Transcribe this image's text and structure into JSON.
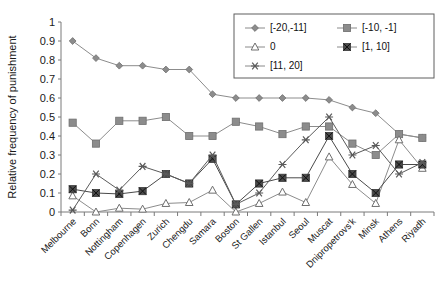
{
  "chart_data": {
    "type": "line",
    "title": "",
    "xlabel": "",
    "ylabel": "Relative frequency of punishment",
    "ylim": [
      0,
      1
    ],
    "ytick_labels": [
      "0",
      "0.1",
      "0.2",
      "0.3",
      "0.4",
      "0.5",
      "0.6",
      "0.7",
      "0.8",
      "0.9",
      "1"
    ],
    "ytick_values": [
      0,
      0.1,
      0.2,
      0.3,
      0.4,
      0.5,
      0.6,
      0.7,
      0.8,
      0.9,
      1
    ],
    "grid": false,
    "legend_position": "top-right",
    "categories": [
      "Melbourne",
      "Bonn",
      "Nottingham",
      "Copenhagen",
      "Zurich",
      "Chengdu",
      "Samara",
      "Boston",
      "St Gallen",
      "Istanbul",
      "Seoul",
      "Muscat",
      "Dnipropetrovs'k",
      "Minsk",
      "Athens",
      "Riyadh"
    ],
    "series": [
      {
        "name": "[-20,-11]",
        "marker": "diamond",
        "color": "#8c8c8c",
        "values": [
          0.9,
          0.81,
          0.77,
          0.77,
          0.75,
          0.75,
          0.62,
          0.6,
          0.6,
          0.6,
          0.6,
          0.59,
          0.55,
          0.52,
          0.41,
          0.39
        ]
      },
      {
        "name": "[-10, -1]",
        "marker": "square",
        "color": "#8c8c8c",
        "values": [
          0.47,
          0.36,
          0.48,
          0.48,
          0.5,
          0.4,
          0.4,
          0.475,
          0.45,
          0.41,
          0.45,
          0.45,
          0.36,
          0.3,
          0.41,
          0.39
        ]
      },
      {
        "name": "0",
        "marker": "triangle",
        "color": "#8c8c8c",
        "values": [
          0.085,
          0.0,
          0.02,
          0.015,
          0.045,
          0.05,
          0.115,
          0.0,
          0.045,
          0.105,
          0.05,
          0.29,
          0.145,
          0.045,
          0.38,
          0.23
        ]
      },
      {
        "name": "[1, 10]",
        "marker": "star",
        "color": "#4a4a4a",
        "values": [
          0.12,
          0.1,
          0.095,
          0.11,
          0.2,
          0.15,
          0.28,
          0.04,
          0.15,
          0.18,
          0.18,
          0.4,
          0.2,
          0.1,
          0.25,
          0.25
        ]
      },
      {
        "name": "[11, 20]",
        "marker": "asterisk",
        "color": "#5a5a5a",
        "values": [
          0.01,
          0.2,
          0.115,
          0.24,
          0.2,
          0.15,
          0.3,
          0.04,
          0.1,
          0.25,
          0.38,
          0.5,
          0.3,
          0.35,
          0.2,
          0.26
        ]
      }
    ]
  },
  "legend": {
    "entries": [
      {
        "label": "[-20,-11]"
      },
      {
        "label": "[-10, -1]"
      },
      {
        "label": "0"
      },
      {
        "label": "[1, 10]"
      },
      {
        "label": "[11, 20]"
      }
    ]
  }
}
